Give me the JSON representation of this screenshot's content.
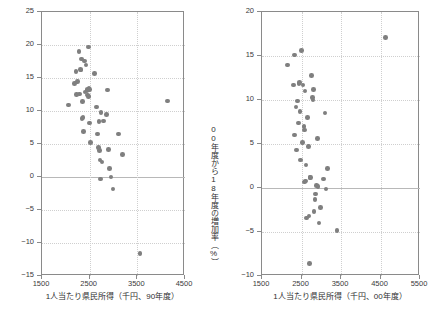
{
  "chart_data": [
    {
      "id": "left",
      "type": "scatter",
      "title": "",
      "xlabel": "1人当たり県民所得（千円、90年度）",
      "ylabel": "90年度から00年度の増加率（%）",
      "xlim": [
        1500,
        4500
      ],
      "ylim": [
        -15,
        25
      ],
      "xticks": [
        1500,
        2500,
        3500,
        4500
      ],
      "yticks": [
        25,
        20,
        15,
        10,
        5,
        0,
        -5,
        -10,
        -15
      ],
      "grid": true,
      "legend": "none",
      "point_color": "#7f7f7f",
      "points": [
        {
          "x": 2060,
          "y": 10.9
        },
        {
          "x": 2180,
          "y": 14.2
        },
        {
          "x": 2210,
          "y": 16.0
        },
        {
          "x": 2230,
          "y": 12.5
        },
        {
          "x": 2250,
          "y": 14.5
        },
        {
          "x": 2280,
          "y": 19.0
        },
        {
          "x": 2290,
          "y": 12.6
        },
        {
          "x": 2310,
          "y": 16.3
        },
        {
          "x": 2320,
          "y": 16.2
        },
        {
          "x": 2330,
          "y": 17.9
        },
        {
          "x": 2340,
          "y": 8.9
        },
        {
          "x": 2350,
          "y": 11.4
        },
        {
          "x": 2360,
          "y": 9.0
        },
        {
          "x": 2370,
          "y": 6.9
        },
        {
          "x": 2390,
          "y": 17.6
        },
        {
          "x": 2400,
          "y": 12.9
        },
        {
          "x": 2420,
          "y": 17.0
        },
        {
          "x": 2440,
          "y": 13.1
        },
        {
          "x": 2450,
          "y": 12.4
        },
        {
          "x": 2460,
          "y": 13.3
        },
        {
          "x": 2470,
          "y": 12.2
        },
        {
          "x": 2480,
          "y": 19.7
        },
        {
          "x": 2490,
          "y": 13.4
        },
        {
          "x": 2500,
          "y": 13.3
        },
        {
          "x": 2500,
          "y": 8.2
        },
        {
          "x": 2520,
          "y": 5.2
        },
        {
          "x": 2600,
          "y": 15.7
        },
        {
          "x": 2640,
          "y": 10.6
        },
        {
          "x": 2660,
          "y": 6.5
        },
        {
          "x": 2690,
          "y": 4.5
        },
        {
          "x": 2700,
          "y": 8.4
        },
        {
          "x": 2710,
          "y": 4.0
        },
        {
          "x": 2720,
          "y": 2.6
        },
        {
          "x": 2730,
          "y": -0.3
        },
        {
          "x": 2740,
          "y": 9.8
        },
        {
          "x": 2760,
          "y": 2.3
        },
        {
          "x": 2790,
          "y": 8.5
        },
        {
          "x": 2850,
          "y": 9.5
        },
        {
          "x": 2880,
          "y": 13.2
        },
        {
          "x": 2890,
          "y": 4.2
        },
        {
          "x": 2920,
          "y": 1.3
        },
        {
          "x": 2950,
          "y": 0.0
        },
        {
          "x": 2990,
          "y": -1.8
        },
        {
          "x": 3100,
          "y": 6.5
        },
        {
          "x": 3190,
          "y": 3.4
        },
        {
          "x": 3560,
          "y": -11.6
        },
        {
          "x": 4130,
          "y": 11.5
        }
      ]
    },
    {
      "id": "right",
      "type": "scatter",
      "title": "",
      "xlabel": "1人当たり県民所得（千円、00年度）",
      "ylabel": "00年度から18年度の増加率（%）",
      "xlim": [
        1500,
        5500
      ],
      "ylim": [
        -10,
        20
      ],
      "xticks": [
        1500,
        2500,
        3500,
        4500,
        5500
      ],
      "yticks": [
        20,
        15,
        10,
        5,
        0,
        -5,
        -10
      ],
      "grid": true,
      "legend": "none",
      "point_color": "#7f7f7f",
      "points": [
        {
          "x": 2140,
          "y": 14.0
        },
        {
          "x": 2290,
          "y": 11.7
        },
        {
          "x": 2320,
          "y": 15.1
        },
        {
          "x": 2330,
          "y": 6.0
        },
        {
          "x": 2360,
          "y": 9.2
        },
        {
          "x": 2380,
          "y": 4.3
        },
        {
          "x": 2400,
          "y": 9.9
        },
        {
          "x": 2420,
          "y": 7.4
        },
        {
          "x": 2440,
          "y": 11.9
        },
        {
          "x": 2450,
          "y": 12.0
        },
        {
          "x": 2460,
          "y": 8.7
        },
        {
          "x": 2470,
          "y": 3.2
        },
        {
          "x": 2500,
          "y": 15.6
        },
        {
          "x": 2520,
          "y": 5.2
        },
        {
          "x": 2540,
          "y": 11.7
        },
        {
          "x": 2560,
          "y": 7.0
        },
        {
          "x": 2570,
          "y": 6.6
        },
        {
          "x": 2580,
          "y": 0.7
        },
        {
          "x": 2590,
          "y": 11.0
        },
        {
          "x": 2600,
          "y": 0.8
        },
        {
          "x": 2610,
          "y": 2.6
        },
        {
          "x": 2630,
          "y": -3.4
        },
        {
          "x": 2650,
          "y": 8.0
        },
        {
          "x": 2670,
          "y": 4.7
        },
        {
          "x": 2690,
          "y": -3.2
        },
        {
          "x": 2700,
          "y": -8.6
        },
        {
          "x": 2720,
          "y": 1.2
        },
        {
          "x": 2730,
          "y": 1.2
        },
        {
          "x": 2750,
          "y": 12.8
        },
        {
          "x": 2780,
          "y": 10.3
        },
        {
          "x": 2790,
          "y": 10.0
        },
        {
          "x": 2800,
          "y": 11.2
        },
        {
          "x": 2820,
          "y": -2.7
        },
        {
          "x": 2840,
          "y": -1.3
        },
        {
          "x": 2860,
          "y": -0.7
        },
        {
          "x": 2880,
          "y": 0.3
        },
        {
          "x": 2900,
          "y": 5.6
        },
        {
          "x": 2920,
          "y": 0.2
        },
        {
          "x": 2940,
          "y": -4.0
        },
        {
          "x": 2980,
          "y": -2.2
        },
        {
          "x": 3050,
          "y": 1.0
        },
        {
          "x": 3100,
          "y": 8.5
        },
        {
          "x": 3120,
          "y": -0.1
        },
        {
          "x": 3160,
          "y": 2.2
        },
        {
          "x": 3400,
          "y": -4.8
        },
        {
          "x": 4630,
          "y": 17.1
        }
      ]
    }
  ]
}
